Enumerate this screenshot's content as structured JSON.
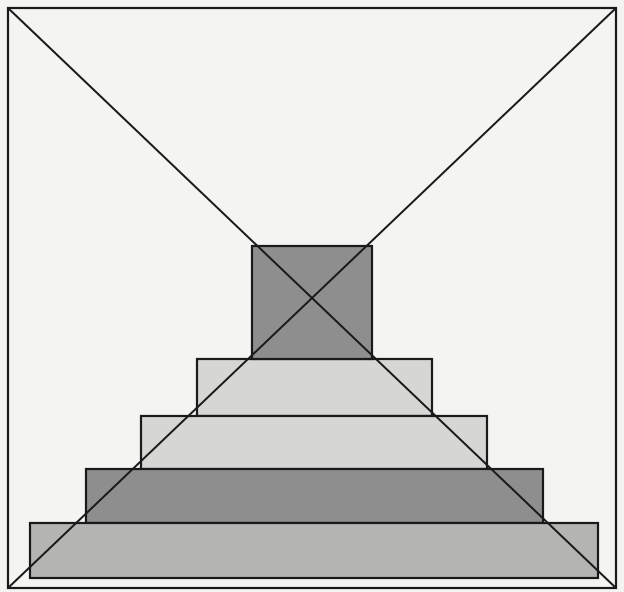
{
  "figure": {
    "type": "geometric-perspective-diagram",
    "colors": {
      "background": "#f4f4f2",
      "stroke": "#1a1a1a",
      "dark_fill": "#8e8e8e",
      "light_fill": "#d6d6d4",
      "mid_fill": "#b4b4b2"
    },
    "frame": {
      "x": 8,
      "y": 8,
      "width": 608,
      "height": 580
    },
    "diagonals": [
      {
        "x1": 8,
        "y1": 8,
        "x2": 616,
        "y2": 588
      },
      {
        "x1": 616,
        "y1": 8,
        "x2": 8,
        "y2": 588
      }
    ],
    "center_square": {
      "x": 252,
      "y": 246,
      "width": 120,
      "height": 113,
      "fill": "dark"
    },
    "tiers": [
      {
        "label": "tier-1",
        "x": 197,
        "y": 359,
        "width": 235,
        "height": 57,
        "fill": "light"
      },
      {
        "label": "tier-2",
        "x": 141,
        "y": 416,
        "width": 346,
        "height": 53,
        "fill": "light"
      },
      {
        "label": "tier-3",
        "x": 86,
        "y": 469,
        "width": 457,
        "height": 54,
        "fill": "dark"
      },
      {
        "label": "tier-4",
        "x": 30,
        "y": 523,
        "width": 568,
        "height": 55,
        "fill": "mid"
      }
    ]
  }
}
